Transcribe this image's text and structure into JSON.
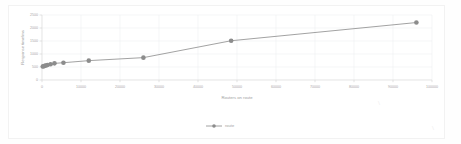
{
  "chart_data": {
    "type": "line",
    "title": "",
    "xlabel": "Routers on route",
    "ylabel": "Response time/ms",
    "xlim": [
      0,
      100000
    ],
    "ylim": [
      0,
      2500
    ],
    "xticks": [
      0,
      10000,
      20000,
      30000,
      40000,
      50000,
      60000,
      70000,
      80000,
      90000,
      100000
    ],
    "xticklabels": [
      "0",
      "10000",
      "20000",
      "30000",
      "40000",
      "50000",
      "60000",
      "70000",
      "80000",
      "90000",
      "100000"
    ],
    "yticks": [
      0,
      500,
      1000,
      1500,
      2000,
      2500
    ],
    "yticklabels": [
      "0",
      "500",
      "1000",
      "1500",
      "2000",
      "2500"
    ],
    "grid": true,
    "legend_position": "bottom",
    "series": [
      {
        "name": "route",
        "marker": "circle",
        "color": "#8c8c8c",
        "x": [
          200,
          400,
          700,
          1000,
          1400,
          2200,
          3200,
          5500,
          12000,
          26000,
          48500,
          96000
        ],
        "y": [
          520,
          530,
          545,
          560,
          575,
          605,
          640,
          665,
          745,
          860,
          1510,
          2210
        ]
      }
    ]
  },
  "legend": {
    "entries": [
      {
        "label": "route",
        "color": "#8c8c8c"
      }
    ]
  },
  "axes": {
    "x_title": "Routers on route",
    "y_title": "Response time/ms"
  },
  "colors": {
    "series": "#8c8c8c",
    "grid": "#eef0f2",
    "axis": "#d9d9d9",
    "tick_text": "#a8a8a8",
    "background": "#ffffff"
  },
  "artifacts": {
    "mark_right_upper": "\\",
    "mark_right_lower": "\\"
  }
}
